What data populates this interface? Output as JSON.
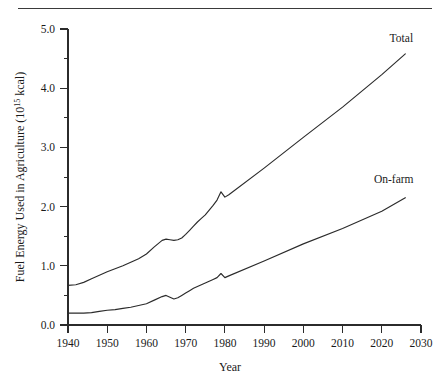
{
  "chart_data": {
    "type": "line",
    "title": "",
    "xlabel": "Year",
    "ylabel": "Fuel Energy Used in Agriculture (10^15 kcal)",
    "ylabel_prefix": "Fuel Energy Used in Agriculture (10",
    "ylabel_exponent": "15",
    "ylabel_suffix": " kcal)",
    "xlim": [
      1940,
      2030
    ],
    "ylim": [
      0.0,
      5.0
    ],
    "grid": false,
    "legend_position": "inline-right",
    "x_ticks": [
      1940,
      1950,
      1960,
      1970,
      1980,
      1990,
      2000,
      2010,
      2020,
      2030
    ],
    "x_tick_labels": [
      "1940",
      "1950",
      "1960",
      "1970",
      "1980",
      "1990",
      "2000",
      "2010",
      "2020",
      "2030"
    ],
    "y_ticks": [
      0.0,
      1.0,
      2.0,
      3.0,
      4.0,
      5.0
    ],
    "y_tick_labels": [
      "0.0",
      "1.0",
      "2.0",
      "3.0",
      "4.0",
      "5.0"
    ],
    "y_minor_ticks": [
      0.5,
      1.5,
      2.5,
      3.5,
      4.5
    ],
    "series": [
      {
        "name": "Total",
        "label": "Total",
        "x": [
          1940,
          1942,
          1944,
          1946,
          1948,
          1950,
          1952,
          1954,
          1956,
          1958,
          1960,
          1962,
          1964,
          1965,
          1966,
          1967,
          1968,
          1969,
          1970,
          1971,
          1972,
          1973,
          1974,
          1975,
          1976,
          1977,
          1978,
          1979,
          1980,
          1981,
          1990,
          2000,
          2010,
          2020,
          2026
        ],
        "values": [
          0.67,
          0.68,
          0.72,
          0.78,
          0.84,
          0.9,
          0.95,
          1.0,
          1.06,
          1.12,
          1.2,
          1.32,
          1.43,
          1.45,
          1.44,
          1.43,
          1.44,
          1.47,
          1.53,
          1.6,
          1.67,
          1.74,
          1.8,
          1.86,
          1.94,
          2.02,
          2.11,
          2.25,
          2.16,
          2.2,
          2.65,
          3.17,
          3.68,
          4.23,
          4.58
        ]
      },
      {
        "name": "On-farm",
        "label": "On-farm",
        "x": [
          1940,
          1942,
          1944,
          1946,
          1948,
          1950,
          1952,
          1954,
          1956,
          1958,
          1960,
          1962,
          1964,
          1965,
          1966,
          1967,
          1968,
          1969,
          1970,
          1971,
          1972,
          1973,
          1974,
          1975,
          1976,
          1977,
          1978,
          1979,
          1980,
          1981,
          1990,
          2000,
          2010,
          2020,
          2026
        ],
        "values": [
          0.2,
          0.2,
          0.2,
          0.21,
          0.23,
          0.25,
          0.26,
          0.28,
          0.3,
          0.33,
          0.36,
          0.42,
          0.48,
          0.5,
          0.47,
          0.44,
          0.46,
          0.5,
          0.54,
          0.58,
          0.62,
          0.65,
          0.68,
          0.71,
          0.74,
          0.77,
          0.8,
          0.87,
          0.8,
          0.83,
          1.08,
          1.37,
          1.63,
          1.92,
          2.15
        ]
      }
    ],
    "annotations": [
      {
        "text": "Total",
        "x": 2022,
        "y": 4.78
      },
      {
        "text": "On-farm",
        "x": 2018,
        "y": 2.4
      }
    ]
  }
}
